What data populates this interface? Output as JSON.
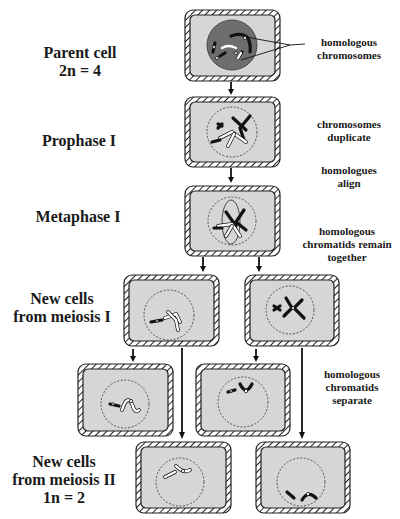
{
  "stages": {
    "parent": {
      "line1": "Parent cell",
      "line2": "2n = 4"
    },
    "prophase": {
      "line1": "Prophase I"
    },
    "metaphase": {
      "line1": "Metaphase I"
    },
    "meiosis1": {
      "line1": "New cells",
      "line2": "from meiosis I"
    },
    "meiosis2": {
      "line1": "New cells",
      "line2": "from meiosis II",
      "line3": "1n = 2"
    }
  },
  "annotations": {
    "homologous_chromosomes": {
      "line1": "homologous",
      "line2": "chromosomes"
    },
    "chromosomes_duplicate": {
      "line1": "chromosomes",
      "line2": "duplicate"
    },
    "homologues_align": {
      "line1": "homologues",
      "line2": "align"
    },
    "chromatids_remain": {
      "line1": "homologous",
      "line2": "chromatids remain",
      "line3": "together"
    },
    "chromatids_separate": {
      "line1": "homologous",
      "line2": "chromatids",
      "line3": "separate"
    }
  },
  "colors": {
    "cytoplasm": "#d6d6d6",
    "nucleus_parent": "#6e6e6e",
    "outline": "#222222",
    "background": "#ffffff"
  },
  "cells": [
    {
      "id": "parent",
      "stage": "Parent cell"
    },
    {
      "id": "prophase",
      "stage": "Prophase I"
    },
    {
      "id": "metaphase",
      "stage": "Metaphase I"
    },
    {
      "id": "mi-left",
      "stage": "New cells from meiosis I"
    },
    {
      "id": "mi-right",
      "stage": "New cells from meiosis I"
    },
    {
      "id": "mii-a",
      "stage": "New cells from meiosis II"
    },
    {
      "id": "mii-b",
      "stage": "New cells from meiosis II"
    },
    {
      "id": "mii-c",
      "stage": "New cells from meiosis II"
    },
    {
      "id": "mii-d",
      "stage": "New cells from meiosis II"
    }
  ]
}
